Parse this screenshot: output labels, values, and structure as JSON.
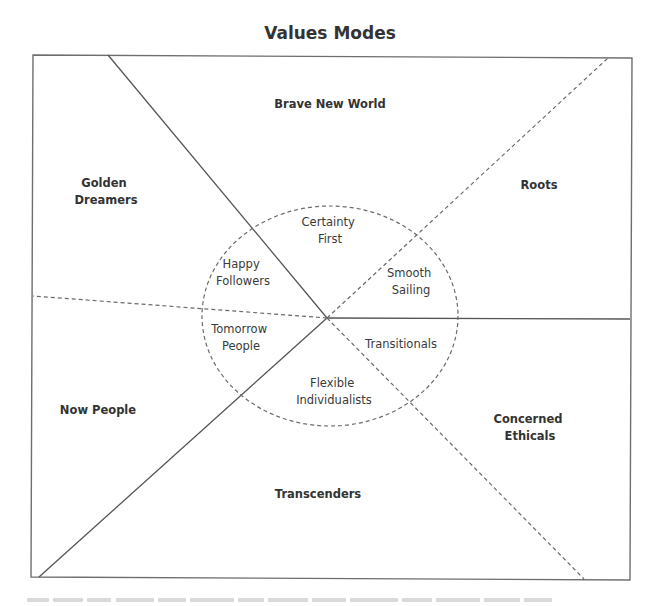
{
  "diagram": {
    "title": "Values Modes",
    "outer_segments": {
      "brave_new_world": "Brave New World",
      "golden_dreamers": [
        "Golden",
        "Dreamers"
      ],
      "roots": "Roots",
      "now_people": "Now People",
      "concerned_ethicals": [
        "Concerned",
        "Ethicals"
      ],
      "transcenders": "Transcenders"
    },
    "inner_segments": {
      "certainty_first": [
        "Certainty",
        "First"
      ],
      "happy_followers": [
        "Happy",
        "Followers"
      ],
      "smooth_sailing": [
        "Smooth",
        "Sailing"
      ],
      "tomorrow_people": [
        "Tomorrow",
        "People"
      ],
      "transitionals": "Transitionals",
      "flexible_individualists": [
        "Flexible",
        "Individualists"
      ]
    },
    "colors": {
      "line": "#555555",
      "text": "#333333",
      "background": "#ffffff"
    }
  }
}
